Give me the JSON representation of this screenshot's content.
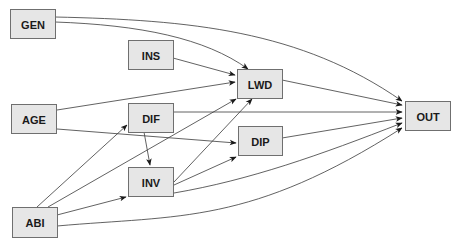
{
  "diagram": {
    "type": "path-diagram",
    "colors": {
      "node_fill": "#e6e6e6",
      "node_border": "#6f6f6f",
      "edge": "#3a3a3a",
      "text": "#1a1a1a"
    },
    "nodes": [
      {
        "id": "GEN",
        "label": "GEN",
        "x": 10,
        "y": 9,
        "w": 45,
        "h": 29
      },
      {
        "id": "INS",
        "label": "INS",
        "x": 128,
        "y": 40,
        "w": 45,
        "h": 29
      },
      {
        "id": "LWD",
        "label": "LWD",
        "x": 237,
        "y": 69,
        "w": 45,
        "h": 29
      },
      {
        "id": "OUT",
        "label": "OUT",
        "x": 405,
        "y": 101,
        "w": 45,
        "h": 29
      },
      {
        "id": "AGE",
        "label": "AGE",
        "x": 11,
        "y": 104,
        "w": 45,
        "h": 29
      },
      {
        "id": "DIF",
        "label": "DIF",
        "x": 128,
        "y": 103,
        "w": 45,
        "h": 29
      },
      {
        "id": "DIP",
        "label": "DIP",
        "x": 238,
        "y": 126,
        "w": 44,
        "h": 29
      },
      {
        "id": "INV",
        "label": "INV",
        "x": 128,
        "y": 167,
        "w": 45,
        "h": 29
      },
      {
        "id": "ABI",
        "label": "ABI",
        "x": 12,
        "y": 207,
        "w": 45,
        "h": 30
      }
    ],
    "edges": [
      {
        "from": "GEN",
        "to": "LWD",
        "d": "M55,22 C140,25 205,38 248,69"
      },
      {
        "from": "GEN",
        "to": "OUT",
        "d": "M55,17 C190,20 300,30 402,101"
      },
      {
        "from": "INS",
        "to": "LWD",
        "d": "M173,58 L235,75"
      },
      {
        "from": "AGE",
        "to": "LWD",
        "d": "M57,110 L235,82"
      },
      {
        "from": "AGE",
        "to": "DIP",
        "d": "M57,129 L236,143"
      },
      {
        "from": "DIF",
        "to": "OUT",
        "d": "M173,112 L402,112"
      },
      {
        "from": "DIF",
        "to": "INV",
        "d": "M144,132 L150,165"
      },
      {
        "from": "LWD",
        "to": "OUT",
        "d": "M282,80 L402,105"
      },
      {
        "from": "DIP",
        "to": "OUT",
        "d": "M282,138 L402,118"
      },
      {
        "from": "INV",
        "to": "LWD",
        "d": "M174,182 L252,99"
      },
      {
        "from": "INV",
        "to": "DIP",
        "d": "M174,185 L236,157"
      },
      {
        "from": "INV",
        "to": "OUT",
        "d": "M174,193 C250,180 320,155 402,123"
      },
      {
        "from": "ABI",
        "to": "DIF",
        "d": "M37,207 L127,125"
      },
      {
        "from": "ABI",
        "to": "LWD",
        "d": "M48,207 L236,99"
      },
      {
        "from": "ABI",
        "to": "INV",
        "d": "M57,215 L126,197"
      },
      {
        "from": "ABI",
        "to": "OUT",
        "d": "M57,226 C180,215 250,225 402,128"
      }
    ]
  }
}
